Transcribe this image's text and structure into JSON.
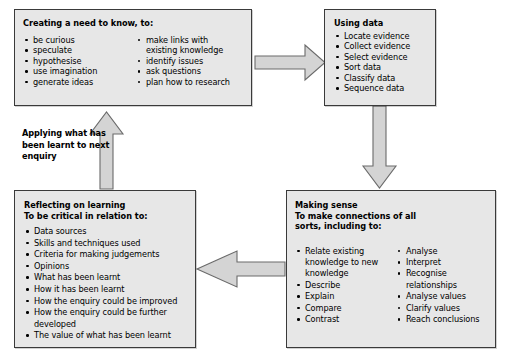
{
  "diagram": {
    "colors": {
      "box_fill": "#e7e7e7",
      "box_border": "#3a3a3a",
      "arrow_fill": "#d4d4d4",
      "arrow_border": "#5a5a5a",
      "text": "#000000",
      "background": "#ffffff"
    },
    "boxes": {
      "creating": {
        "title": "Creating a need to know, to:",
        "column_left": [
          "be curious",
          "speculate",
          "hypothesise",
          "use imagination",
          "generate ideas"
        ],
        "column_right": [
          "make links with",
          "existing knowledge",
          "identify issues",
          "ask questions",
          "plan how to research"
        ]
      },
      "using_data": {
        "title": "Using data",
        "items": [
          "Locate evidence",
          "Collect evidence",
          "Select evidence",
          "Sort data",
          "Classify data",
          "Sequence data"
        ]
      },
      "reflecting": {
        "title_line1": "Reflecting on learning",
        "title_line2": "To be critical in relation to:",
        "items": [
          "Data sources",
          "Skills and techniques used",
          "Criteria for making judgements",
          "Opinions",
          "What has been learnt",
          "How it has been learnt",
          "How the enquiry could be improved",
          "How the enquiry could be further",
          "developed",
          "The value of what has been learnt"
        ]
      },
      "making_sense": {
        "title_line1": "Making sense",
        "title_line2": "To make connections of all",
        "title_line3": "sorts, including to:",
        "column_left": [
          "Relate existing",
          "knowledge to new",
          "knowledge",
          "Describe",
          "Explain",
          "Compare",
          "Contrast"
        ],
        "column_right": [
          "Analyse",
          "Interpret",
          "Recognise",
          "relationships",
          "Analyse values",
          "Clarify values",
          "Reach conclusions"
        ]
      }
    },
    "labels": {
      "applying": "Applying what has been learnt to next enquiry"
    },
    "arrows": [
      {
        "name": "creating-to-using",
        "direction": "right"
      },
      {
        "name": "using-to-making-sense",
        "direction": "down"
      },
      {
        "name": "making-sense-to-reflecting",
        "direction": "left"
      },
      {
        "name": "reflecting-to-creating",
        "direction": "up"
      }
    ]
  }
}
